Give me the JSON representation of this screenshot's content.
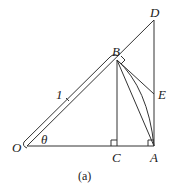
{
  "figure": {
    "caption": "(a)",
    "points": {
      "O": "O",
      "A": "A",
      "B": "B",
      "C": "C",
      "D": "D",
      "E": "E"
    },
    "angle_label": "θ",
    "length_label": "1"
  }
}
